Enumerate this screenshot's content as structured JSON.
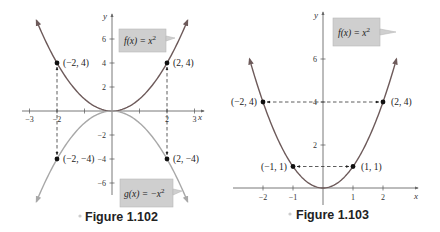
{
  "chart_data": [
    {
      "type": "line",
      "caption": "Figure 1.102",
      "xlabel": "x",
      "ylabel": "y",
      "xlim": [
        -3.3,
        3.3
      ],
      "ylim": [
        -7.5,
        7.5
      ],
      "x_ticks": [
        -3,
        -2,
        -1,
        1,
        2,
        3
      ],
      "x_tick_labels": [
        "-3",
        "-2",
        "",
        "",
        "2",
        "3"
      ],
      "y_ticks": [
        6,
        4,
        2,
        -2,
        -4,
        -6
      ],
      "y_tick_labels": [
        "6",
        "4",
        "2",
        "-2",
        "-4",
        "-6"
      ],
      "grid": false,
      "series": [
        {
          "name": "f(x) = x²",
          "function": "x^2",
          "domain": [
            -2.75,
            2.75
          ],
          "color": "#6d5a5a"
        },
        {
          "name": "g(x) = −x²",
          "function": "-x^2",
          "domain": [
            -2.75,
            2.75
          ],
          "color": "#a8a8a8"
        }
      ],
      "points": [
        {
          "x": -2,
          "y": 4,
          "label": "(−2, 4)"
        },
        {
          "x": 2,
          "y": 4,
          "label": "(2, 4)"
        },
        {
          "x": -2,
          "y": -4,
          "label": "(−2, −4)"
        },
        {
          "x": 2,
          "y": -4,
          "label": "(2, −4)"
        }
      ],
      "reflection_arrows": [
        {
          "from": [
            -2,
            4
          ],
          "to": [
            -2,
            -4
          ]
        },
        {
          "from": [
            2,
            4
          ],
          "to": [
            2,
            -4
          ]
        }
      ],
      "annotations": [
        {
          "text_func": "f(x) = x",
          "sup": "2",
          "near": "top-right"
        },
        {
          "text_func": "g(x) = −x",
          "sup": "2",
          "near": "bottom-right"
        }
      ]
    },
    {
      "type": "line",
      "caption": "Figure 1.103",
      "xlabel": "x",
      "ylabel": "y",
      "xlim": [
        -3,
        3
      ],
      "ylim": [
        -0.5,
        8
      ],
      "x_ticks": [
        -2,
        -1,
        1,
        2
      ],
      "x_tick_labels": [
        "-2",
        "-1",
        "1",
        "2"
      ],
      "y_ticks": [
        6,
        4,
        2
      ],
      "y_tick_labels": [
        "6",
        "4",
        "2"
      ],
      "grid": false,
      "series": [
        {
          "name": "f(x) = x²",
          "function": "x^2",
          "domain": [
            -2.45,
            2.45
          ],
          "color": "#6d5a5a"
        }
      ],
      "points": [
        {
          "x": -2,
          "y": 4,
          "label": "(−2, 4)"
        },
        {
          "x": 2,
          "y": 4,
          "label": "(2, 4)"
        },
        {
          "x": -1,
          "y": 1,
          "label": "(−1, 1)"
        },
        {
          "x": 1,
          "y": 1,
          "label": "(1, 1)"
        }
      ],
      "symmetry_arrows": [
        {
          "from": [
            -2,
            4
          ],
          "to": [
            2,
            4
          ]
        },
        {
          "from": [
            -1,
            1
          ],
          "to": [
            1,
            1
          ]
        }
      ],
      "annotations": [
        {
          "text_func": "f(x) = x",
          "sup": "2",
          "near": "top-right"
        }
      ]
    }
  ],
  "colors": {
    "label_box_fill": "#cfcfcf",
    "label_box_stroke": "#b5b5b5",
    "axis": "#555555",
    "point": "#111111",
    "caption_bullet": "#cccccc"
  }
}
